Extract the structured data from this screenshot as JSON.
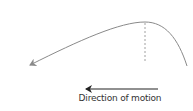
{
  "diagram": {
    "caption": "Direction of motion",
    "colors": {
      "trajectory": "#8a8a8a",
      "apex_marker": "#a0a0a0",
      "motion_arrow": "#222222",
      "text": "#333333"
    },
    "elements": [
      {
        "name": "trajectory-curve",
        "type": "curved arrow",
        "description": "Parabolic path rising from right, peaking, then descending to the left with arrowhead"
      },
      {
        "name": "apex-dashed-line",
        "type": "dashed vertical line",
        "description": "Marks the highest point of the trajectory"
      },
      {
        "name": "motion-arrow",
        "type": "arrow",
        "direction": "left"
      }
    ]
  }
}
